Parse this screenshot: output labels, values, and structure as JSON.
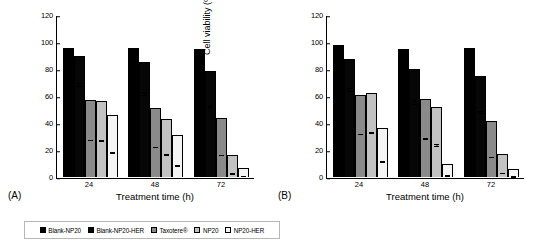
{
  "figure": {
    "panels": [
      {
        "tag": "(A)",
        "xlabel": "Treatment time (h)",
        "ylabel": "Cell viability (%)"
      },
      {
        "tag": "(B)",
        "xlabel": "Treatment time (h)",
        "ylabel": "Cell viability (%)"
      }
    ]
  },
  "legend": {
    "items": [
      {
        "label": "Blank-NP20",
        "color": "#000000"
      },
      {
        "label": "Blank-NP20-HER",
        "color": "#060606"
      },
      {
        "label": "Taxotere®",
        "color": "#8a8a8a"
      },
      {
        "label": "NP20",
        "color": "#c2c2c2"
      },
      {
        "label": "NP20-HER",
        "color": "#f4f4f4"
      }
    ]
  },
  "chart_data": [
    {
      "type": "bar",
      "panel": "(A)",
      "title": "",
      "xlabel": "Treatment time (h)",
      "ylabel": "Cell viability (%)",
      "categories": [
        "24",
        "48",
        "72"
      ],
      "yticks": [
        0,
        20,
        40,
        60,
        80,
        100,
        120
      ],
      "ylim": [
        0,
        120
      ],
      "grid": false,
      "legend_position": "bottom",
      "series": [
        {
          "name": "Blank-NP20",
          "values": [
            96.3,
            95.8,
            95.2
          ],
          "errors": [
            2.6,
            3.3,
            2.8
          ]
        },
        {
          "name": "Blank-NP20-HER",
          "values": [
            90.3,
            85.4,
            79.2
          ],
          "errors": [
            3.4,
            4.2,
            2.6
          ]
        },
        {
          "name": "Taxotere®",
          "values": [
            57.4,
            51.5,
            43.9
          ],
          "errors": [
            1.6,
            1.4,
            1.6
          ]
        },
        {
          "name": "NP20",
          "values": [
            56.6,
            43.5,
            16.2
          ],
          "errors": [
            2.0,
            4.4,
            3.0
          ]
        },
        {
          "name": "NP20-HER",
          "values": [
            46.3,
            31.3,
            7.0
          ],
          "errors": [
            1.4,
            1.3,
            1.6
          ]
        }
      ]
    },
    {
      "type": "bar",
      "panel": "(B)",
      "title": "",
      "xlabel": "Treatment time (h)",
      "ylabel": "Cell viability (%)",
      "categories": [
        "24",
        "48",
        "72"
      ],
      "yticks": [
        0,
        20,
        40,
        60,
        80,
        100,
        120
      ],
      "ylim": [
        0,
        120
      ],
      "grid": false,
      "legend_position": "bottom",
      "series": [
        {
          "name": "Blank-NP20",
          "values": [
            98.4,
            95.7,
            95.9
          ],
          "errors": [
            2.7,
            3.0,
            2.7
          ]
        },
        {
          "name": "Blank-NP20-HER",
          "values": [
            87.8,
            80.7,
            75.3
          ],
          "errors": [
            4.1,
            5.0,
            3.5
          ]
        },
        {
          "name": "Taxotere®",
          "values": [
            61.4,
            58.2,
            41.6
          ],
          "errors": [
            1.7,
            2.5,
            1.5
          ]
        },
        {
          "name": "NP20",
          "values": [
            62.6,
            52.4,
            17.1
          ],
          "errors": [
            2.2,
            4.6,
            3.3
          ]
        },
        {
          "name": "NP20-HER",
          "values": [
            36.9,
            9.4,
            6.1
          ],
          "errors": [
            1.2,
            1.6,
            2.0
          ]
        }
      ]
    }
  ]
}
